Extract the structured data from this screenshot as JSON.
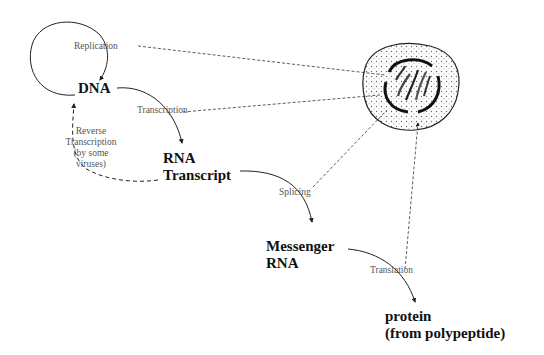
{
  "diagram": {
    "nodes": {
      "dna": "DNA",
      "rna_line1": "RNA",
      "rna_line2": "Transcript",
      "mrna_line1": "Messenger",
      "mrna_line2": "RNA",
      "protein_line1": "protein",
      "protein_line2": "(from polypeptide)"
    },
    "processes": {
      "replication": "Replication",
      "transcription": "Transcription",
      "reverse_line1": "Reverse",
      "reverse_line2": "Transcription",
      "reverse_line3": "(by some",
      "reverse_line4": "viruses)",
      "splicing": "Splicing",
      "translation": "Translation"
    },
    "icons": {
      "cell": "cell-with-nucleus-icon"
    },
    "colors": {
      "text": "#111111",
      "process_text": "#555555",
      "line": "#222222"
    }
  }
}
